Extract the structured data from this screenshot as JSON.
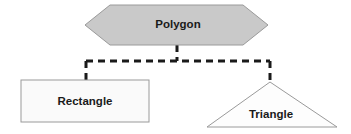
{
  "diagram": {
    "type": "class-hierarchy",
    "background_color": "#ffffff",
    "nodes": [
      {
        "id": "polygon",
        "label": "Polygon",
        "shape": "hexagon",
        "role": "parent",
        "fill_color": "#c9c9c9",
        "stroke_color": "#9a9a9a",
        "text_color": "#1a1a1a",
        "points": "85,25 110,5 243,5 268,25 243,45 110,45",
        "label_x": 178,
        "label_y": 25
      },
      {
        "id": "rectangle",
        "label": "Rectangle",
        "shape": "rectangle",
        "role": "child",
        "fill_color": "#fafafa",
        "stroke_color": "#9a9a9a",
        "text_color": "#1a1a1a",
        "x": 21,
        "y": 80,
        "width": 128,
        "height": 42,
        "label_x": 85,
        "label_y": 102
      },
      {
        "id": "triangle",
        "label": "Triangle",
        "shape": "triangle",
        "role": "child",
        "fill_color": "#fdfdfd",
        "stroke_color": "#9a9a9a",
        "text_color": "#1a1a1a",
        "points": "270,82 337,127 207,127",
        "label_x": 271,
        "label_y": 115
      }
    ],
    "connectors": {
      "style": "dashed",
      "color": "#1a1a1a",
      "stroke_width": 3,
      "dash_pattern": "7,5",
      "segments": [
        {
          "id": "stem-from-polygon",
          "from": "polygon",
          "d": "M 177 45 L 177 61"
        },
        {
          "id": "horizontal-bus",
          "from": "polygon",
          "d": "M 86 61 L 270 61"
        },
        {
          "id": "drop-to-rectangle",
          "to": "rectangle",
          "d": "M 86 61 L 86 80"
        },
        {
          "id": "drop-to-triangle",
          "to": "triangle",
          "d": "M 270 61 L 270 82"
        }
      ]
    }
  }
}
